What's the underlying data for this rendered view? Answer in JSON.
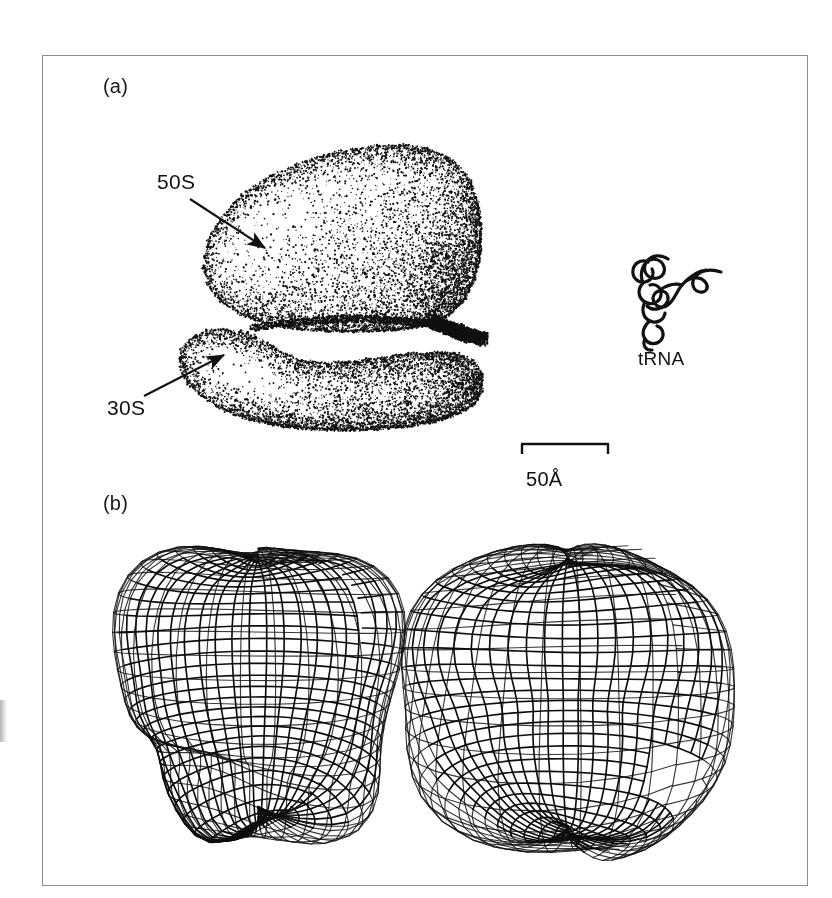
{
  "figure": {
    "background_color": "#ffffff",
    "frame_color": "#8e8e8e",
    "ink_color": "#111111",
    "width": 832,
    "height": 898
  },
  "panels": [
    {
      "id": "a",
      "label": "(a)",
      "caption_position": "top-left",
      "description": "Stipple-shaded drawing of the 70S ribosome showing the 50S and 30S subunits, with a tRNA molecule drawn to the same scale"
    },
    {
      "id": "b",
      "label": "(b)",
      "caption_position": "mid-left",
      "description": "Two wireframe mesh surface models of the ribosome seen from different orientations"
    }
  ],
  "annotations": {
    "subunit_large": "50S",
    "subunit_small": "30S",
    "trna": "tRNA"
  },
  "scalebar": {
    "label": "50Å",
    "length_px": 88,
    "value": 50,
    "unit": "Å"
  },
  "chart_data": {
    "type": "diagram",
    "components": [
      {
        "name": "50S",
        "role": "large ribosomal subunit",
        "panel": "a"
      },
      {
        "name": "30S",
        "role": "small ribosomal subunit",
        "panel": "a"
      },
      {
        "name": "tRNA",
        "role": "transfer RNA shown for scale",
        "panel": "a"
      }
    ],
    "scale": {
      "bar_label": "50Å",
      "bar_value": 50,
      "unit": "angstrom"
    },
    "models": [
      {
        "panel": "b",
        "position": "left",
        "style": "wireframe mesh",
        "feature": "pointed peak with central cleft"
      },
      {
        "panel": "b",
        "position": "right",
        "style": "wireframe mesh",
        "feature": "rotated view showing a through-hole opening"
      }
    ]
  }
}
